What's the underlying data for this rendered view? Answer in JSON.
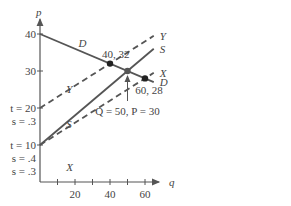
{
  "chart_data": {
    "type": "line",
    "title": "",
    "xlabel": "q",
    "ylabel": "p",
    "xlim": [
      0,
      68
    ],
    "ylim": [
      0,
      44
    ],
    "x_ticks": [
      10,
      20,
      30,
      40,
      50,
      60
    ],
    "x_tick_labels": [
      {
        "value": 20,
        "label": "20"
      },
      {
        "value": 40,
        "label": "40"
      },
      {
        "value": 60,
        "label": "60"
      }
    ],
    "y_ticks": [
      {
        "value": 40,
        "label": "40"
      },
      {
        "value": 30,
        "label": "30"
      },
      {
        "value": 20,
        "label": "t = 20"
      },
      {
        "value": 10,
        "label": "t = 10"
      }
    ],
    "y_annotations": [
      {
        "value": 20,
        "lines": [
          "s = .3"
        ]
      },
      {
        "value": 10,
        "lines": [
          "s = .4",
          "s = .3"
        ]
      }
    ],
    "grid": false,
    "series": [
      {
        "name": "D",
        "intercept": 40,
        "slope": -0.2,
        "style": "solid",
        "x": [
          0,
          65
        ],
        "label_x": 15,
        "end_label": "D"
      },
      {
        "name": "S",
        "intercept": 10,
        "slope": 0.4,
        "style": "solid",
        "x": [
          0,
          65
        ],
        "label_x": 15,
        "end_label": "S"
      },
      {
        "name": "Y",
        "intercept": 20,
        "slope": 0.3,
        "style": "dashed",
        "x": [
          0,
          65
        ],
        "label_x": 15,
        "end_label": "Y"
      },
      {
        "name": "X",
        "intercept": 10,
        "slope": 0.3,
        "style": "dashed",
        "x": [
          0,
          65
        ],
        "label_x": 15,
        "end_label": "X"
      }
    ],
    "points": [
      {
        "x": 40,
        "y": 32,
        "label": "40, 32",
        "color": "#222222"
      },
      {
        "x": 50,
        "y": 30,
        "label": "",
        "color": "#555555"
      },
      {
        "x": 60,
        "y": 28,
        "label": "60, 28",
        "color": "#222222"
      }
    ],
    "annotations": [
      {
        "text": "Q = 50, P = 30",
        "arrow_to": {
          "x": 50,
          "y": 30
        }
      }
    ],
    "colors": {
      "line": "#555555",
      "text": "#444444"
    }
  }
}
